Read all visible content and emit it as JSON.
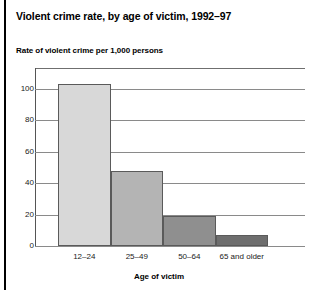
{
  "chart_data": {
    "type": "bar",
    "title": "Violent crime rate, by age of victim, 1992–97",
    "subtitle": "Rate of violent crime per 1,000 persons",
    "xlabel": "Age of victim",
    "ylabel": "",
    "categories": [
      "12–24",
      "25–49",
      "50–64",
      "65 and older"
    ],
    "values": [
      103,
      48,
      19,
      7
    ],
    "ylim": [
      0,
      115
    ],
    "yticks": [
      0,
      20,
      40,
      60,
      80,
      100
    ],
    "ytick_labels": [
      "0",
      "20",
      "40",
      "60",
      "80",
      "100"
    ],
    "grid": true,
    "legend": "none",
    "bar_colors": [
      "#d8d8d8",
      "#b4b4b4",
      "#8f8f8f",
      "#6e6e6e"
    ],
    "bar_edge_color": "#5a5a5a",
    "grid_color": "#8a8a8a",
    "background": "#ffffff",
    "text_color": "#000000"
  }
}
